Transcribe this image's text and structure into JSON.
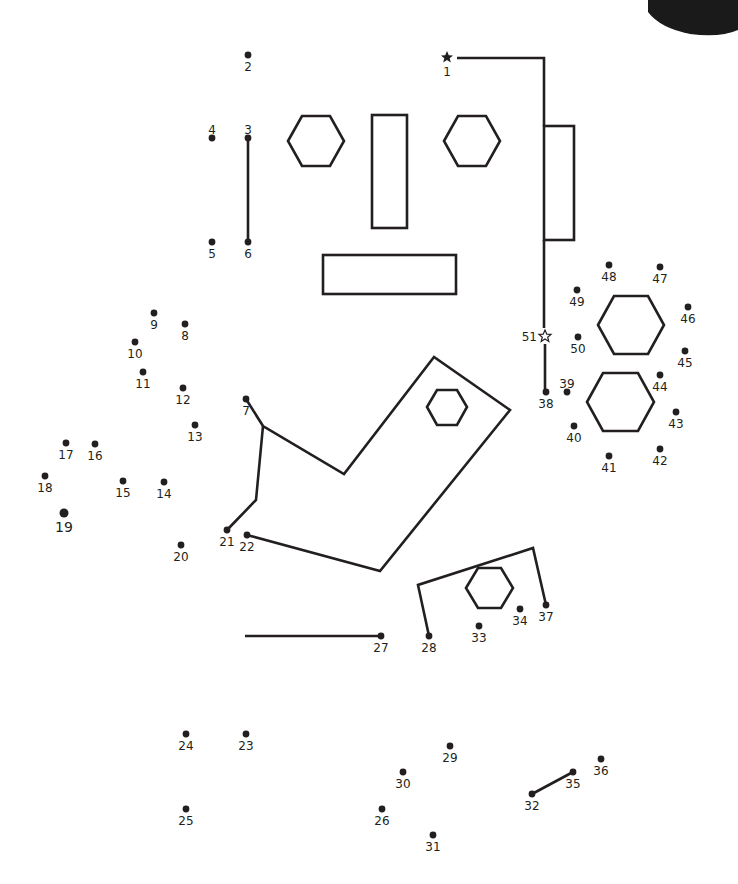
{
  "puzzle": {
    "ink_color": "#231f20",
    "background": "#ffffff",
    "corner_blob_color": "#1a1a1a",
    "start_marker": {
      "label": "1",
      "x": 447,
      "y": 57,
      "icon": "filled-star"
    },
    "end_marker": {
      "label": "51",
      "x": 545,
      "y": 336,
      "icon": "outline-star"
    },
    "dots": [
      {
        "n": "2",
        "x": 248,
        "y": 55
      },
      {
        "n": "3",
        "x": 248,
        "y": 138
      },
      {
        "n": "4",
        "x": 212,
        "y": 138
      },
      {
        "n": "5",
        "x": 212,
        "y": 242
      },
      {
        "n": "6",
        "x": 248,
        "y": 242
      },
      {
        "n": "7",
        "x": 246,
        "y": 399
      },
      {
        "n": "8",
        "x": 185,
        "y": 324
      },
      {
        "n": "9",
        "x": 154,
        "y": 313
      },
      {
        "n": "10",
        "x": 135,
        "y": 342
      },
      {
        "n": "11",
        "x": 143,
        "y": 372
      },
      {
        "n": "12",
        "x": 183,
        "y": 388
      },
      {
        "n": "13",
        "x": 195,
        "y": 425
      },
      {
        "n": "14",
        "x": 164,
        "y": 482
      },
      {
        "n": "15",
        "x": 123,
        "y": 481
      },
      {
        "n": "16",
        "x": 95,
        "y": 444
      },
      {
        "n": "17",
        "x": 66,
        "y": 443
      },
      {
        "n": "18",
        "x": 45,
        "y": 476
      },
      {
        "n": "19",
        "x": 64,
        "y": 513
      },
      {
        "n": "20",
        "x": 181,
        "y": 545
      },
      {
        "n": "21",
        "x": 227,
        "y": 530
      },
      {
        "n": "22",
        "x": 247,
        "y": 535
      },
      {
        "n": "23",
        "x": 246,
        "y": 734
      },
      {
        "n": "24",
        "x": 186,
        "y": 734
      },
      {
        "n": "25",
        "x": 186,
        "y": 809
      },
      {
        "n": "26",
        "x": 382,
        "y": 809
      },
      {
        "n": "27",
        "x": 381,
        "y": 636
      },
      {
        "n": "28",
        "x": 429,
        "y": 636
      },
      {
        "n": "29",
        "x": 450,
        "y": 746
      },
      {
        "n": "30",
        "x": 403,
        "y": 772
      },
      {
        "n": "31",
        "x": 433,
        "y": 835
      },
      {
        "n": "32",
        "x": 532,
        "y": 794
      },
      {
        "n": "33",
        "x": 479,
        "y": 626
      },
      {
        "n": "34",
        "x": 520,
        "y": 609
      },
      {
        "n": "35",
        "x": 573,
        "y": 772
      },
      {
        "n": "36",
        "x": 601,
        "y": 759
      },
      {
        "n": "37",
        "x": 546,
        "y": 605
      },
      {
        "n": "38",
        "x": 546,
        "y": 392
      },
      {
        "n": "39",
        "x": 567,
        "y": 392
      },
      {
        "n": "40",
        "x": 574,
        "y": 426
      },
      {
        "n": "41",
        "x": 609,
        "y": 456
      },
      {
        "n": "42",
        "x": 660,
        "y": 449
      },
      {
        "n": "43",
        "x": 676,
        "y": 412
      },
      {
        "n": "44",
        "x": 660,
        "y": 375
      },
      {
        "n": "45",
        "x": 685,
        "y": 351
      },
      {
        "n": "46",
        "x": 688,
        "y": 307
      },
      {
        "n": "47",
        "x": 660,
        "y": 267
      },
      {
        "n": "48",
        "x": 609,
        "y": 265
      },
      {
        "n": "49",
        "x": 577,
        "y": 290
      },
      {
        "n": "50",
        "x": 578,
        "y": 337
      }
    ]
  }
}
